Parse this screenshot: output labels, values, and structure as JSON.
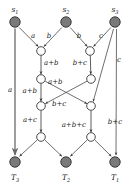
{
  "figure": {
    "type": "network-coding-butterfly-graph",
    "title": "",
    "colors": {
      "source_sink_fill": "#7a7a7a",
      "source_sink_stroke": "#3a3a3a",
      "relay_fill": "#ffffff",
      "relay_stroke": "#4a4a4a",
      "edge": "#4a4a4a",
      "thick_edge": "#9a9a9a",
      "text": "#1a1a1a",
      "background": "#ffffff"
    },
    "sources": [
      {
        "id": "s1",
        "label": "s",
        "sub": "1",
        "x": 15,
        "y": 22
      },
      {
        "id": "s2",
        "label": "s",
        "sub": "2",
        "x": 66,
        "y": 22
      },
      {
        "id": "s3",
        "label": "s",
        "sub": "3",
        "x": 115,
        "y": 22
      }
    ],
    "sinks": [
      {
        "id": "T3",
        "label": "T",
        "sub": "3",
        "x": 15,
        "y": 162
      },
      {
        "id": "T2",
        "label": "T",
        "sub": "2",
        "x": 66,
        "y": 162
      },
      {
        "id": "T1",
        "label": "T",
        "sub": "1",
        "x": 115,
        "y": 162
      }
    ],
    "relays": [
      {
        "id": "n1L",
        "x": 41,
        "y": 51
      },
      {
        "id": "n1R",
        "x": 90,
        "y": 51
      },
      {
        "id": "n2L",
        "x": 41,
        "y": 79
      },
      {
        "id": "n2R",
        "x": 91,
        "y": 79
      },
      {
        "id": "n3L",
        "x": 41,
        "y": 106
      },
      {
        "id": "n3R",
        "x": 91,
        "y": 106
      },
      {
        "id": "n4L",
        "x": 41,
        "y": 137
      },
      {
        "id": "n4R",
        "x": 91,
        "y": 137
      }
    ],
    "edges": [
      {
        "from": "s1",
        "to": "T3",
        "label": "a",
        "style": "thick",
        "lx": 10,
        "ly": 92
      },
      {
        "from": "s1",
        "to": "n1L",
        "label": "a",
        "style": "normal",
        "lx": 33,
        "ly": 38
      },
      {
        "from": "s2",
        "to": "n1L",
        "label": "b",
        "style": "normal",
        "lx": 49,
        "ly": 38
      },
      {
        "from": "s2",
        "to": "n1R",
        "label": "b",
        "style": "normal",
        "lx": 79,
        "ly": 38
      },
      {
        "from": "s3",
        "to": "n1R",
        "label": "c",
        "style": "normal",
        "lx": 101,
        "ly": 38
      },
      {
        "from": "s3",
        "to": "n3R",
        "label": "c",
        "style": "normal",
        "lx": 118,
        "ly": 60
      },
      {
        "from": "s3",
        "to": "T1",
        "label": "b+c",
        "style": "normal",
        "lx": 113,
        "ly": 124
      },
      {
        "from": "n1L",
        "to": "n2L",
        "label": "a+b",
        "style": "normal",
        "lx": 44,
        "ly": 64
      },
      {
        "from": "n1R",
        "to": "n2R",
        "label": "b+c",
        "style": "normal",
        "lx": 74,
        "ly": 64
      },
      {
        "from": "n2L",
        "to": "n3L",
        "label": "a+b",
        "style": "normal",
        "lx": 22,
        "ly": 91
      },
      {
        "from": "n2L",
        "to": "n3R",
        "label": "a+b",
        "style": "normal",
        "lx": 57,
        "ly": 82
      },
      {
        "from": "n2R",
        "to": "n3L",
        "label": "b+c",
        "style": "normal",
        "lx": 61,
        "ly": 105
      },
      {
        "from": "n3L",
        "to": "n4L",
        "label": "a+c",
        "style": "normal",
        "lx": 22,
        "ly": 121
      },
      {
        "from": "n3R",
        "to": "n4R",
        "label": "a+b+c",
        "style": "normal",
        "lx": 62,
        "ly": 126
      },
      {
        "from": "n4L",
        "to": "T3",
        "label": "",
        "style": "normal",
        "lx": 0,
        "ly": 0
      },
      {
        "from": "n4L",
        "to": "T2",
        "label": "",
        "style": "normal",
        "lx": 0,
        "ly": 0
      },
      {
        "from": "n4R",
        "to": "T2",
        "label": "",
        "style": "normal",
        "lx": 0,
        "ly": 0
      },
      {
        "from": "n4R",
        "to": "T1",
        "label": "",
        "style": "normal",
        "lx": 0,
        "ly": 0
      }
    ],
    "symbols": {
      "a": "a",
      "b": "b",
      "c": "c"
    }
  }
}
